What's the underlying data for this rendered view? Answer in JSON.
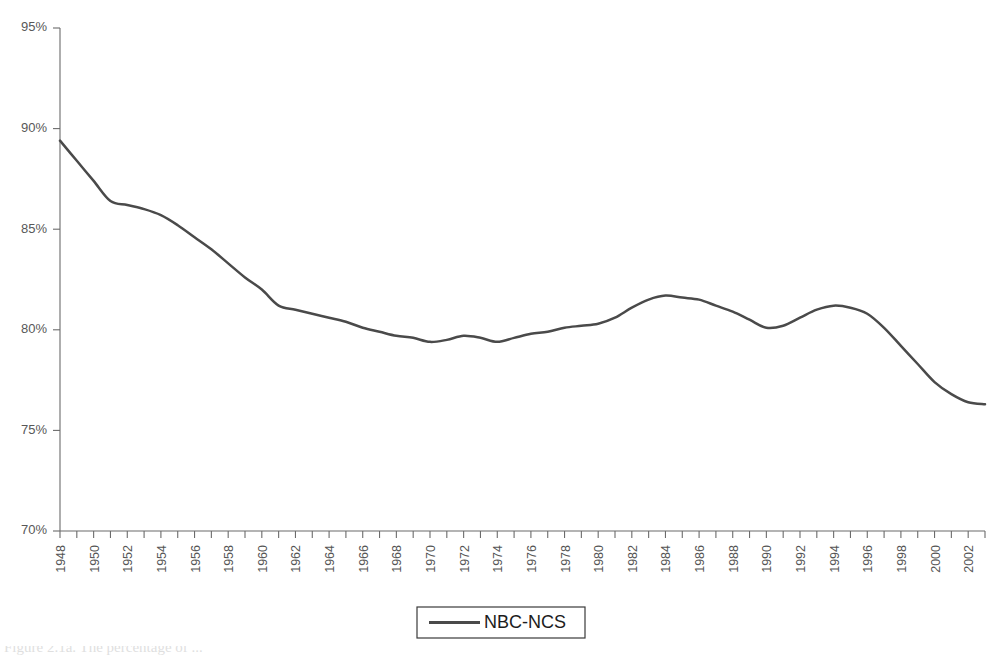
{
  "chart_data": {
    "type": "line",
    "title": "",
    "xlabel": "",
    "ylabel": "",
    "xlim": [
      1948,
      2003
    ],
    "ylim": [
      70,
      95
    ],
    "y_tick_values": [
      95,
      90,
      85,
      80,
      75,
      70
    ],
    "y_tick_labels": [
      "95%",
      "90%",
      "85%",
      "80%",
      "75%",
      "70%"
    ],
    "x_tick_labels": [
      "1948",
      "1950",
      "1952",
      "1954",
      "1956",
      "1958",
      "1960",
      "1962",
      "1964",
      "1966",
      "1968",
      "1970",
      "1972",
      "1974",
      "1976",
      "1978",
      "1980",
      "1982",
      "1984",
      "1986",
      "1988",
      "1990",
      "1992",
      "1994",
      "1996",
      "1998",
      "2000",
      "2002"
    ],
    "x_tick_label_rotation": -90,
    "x_minor_tick_interval": 1,
    "grid": false,
    "legend_position": "bottom-center",
    "series": [
      {
        "name": "NBC-NCS",
        "color": "#4a4a4a",
        "x": [
          1948,
          1949,
          1950,
          1951,
          1952,
          1953,
          1954,
          1955,
          1956,
          1957,
          1958,
          1959,
          1960,
          1961,
          1962,
          1963,
          1964,
          1965,
          1966,
          1967,
          1968,
          1969,
          1970,
          1971,
          1972,
          1973,
          1974,
          1975,
          1976,
          1977,
          1978,
          1979,
          1980,
          1981,
          1982,
          1983,
          1984,
          1985,
          1986,
          1987,
          1988,
          1989,
          1990,
          1991,
          1992,
          1993,
          1994,
          1995,
          1996,
          1997,
          1998,
          1999,
          2000,
          2001,
          2002,
          2003
        ],
        "values": [
          89.4,
          88.4,
          87.4,
          86.4,
          86.2,
          86.0,
          85.7,
          85.2,
          84.6,
          84.0,
          83.3,
          82.6,
          82.0,
          81.2,
          81.0,
          80.8,
          80.6,
          80.4,
          80.1,
          79.9,
          79.7,
          79.6,
          79.4,
          79.5,
          79.7,
          79.6,
          79.4,
          79.6,
          79.8,
          79.9,
          80.1,
          80.2,
          80.3,
          80.6,
          81.1,
          81.5,
          81.7,
          81.6,
          81.5,
          81.2,
          80.9,
          80.5,
          80.1,
          80.2,
          80.6,
          81.0,
          81.2,
          81.1,
          80.8,
          80.1,
          79.2,
          78.3,
          77.4,
          76.8,
          76.4,
          76.3
        ]
      }
    ]
  },
  "legend": {
    "entries": [
      {
        "label": "NBC-NCS",
        "color": "#4a4a4a"
      }
    ]
  },
  "caption": {
    "text": "Figure 2.1a.  The percentage of ...",
    "visible_fragment": true
  },
  "colors": {
    "line": "#4a4a4a",
    "axis": "#6b6b6b",
    "tick_label": "#555555",
    "background": "#ffffff"
  }
}
